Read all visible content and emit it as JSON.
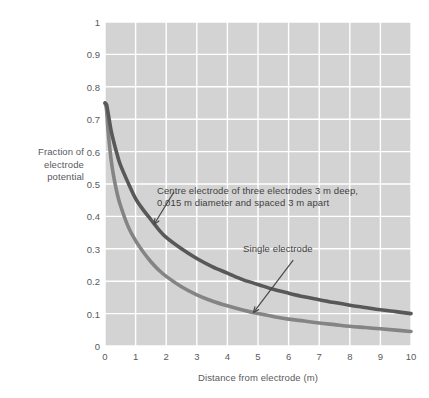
{
  "figure": {
    "name": "electrode-potential-decay-chart",
    "background_color": "#ffffff",
    "plot_background_color": "#d3d3d3",
    "gridline_color": "#ffffff"
  },
  "axes": {
    "y_title_lines": [
      "Fraction of",
      "electrode",
      "potential"
    ],
    "x_title": "Distance from electrode (m)",
    "y_ticks": [
      "0",
      "0.1",
      "0.2",
      "0.3",
      "0.4",
      "0.5",
      "0.6",
      "0.7",
      "0.8",
      "0.9",
      "1"
    ],
    "x_ticks": [
      "0",
      "1",
      "2",
      "3",
      "4",
      "5",
      "6",
      "7",
      "8",
      "9",
      "10"
    ]
  },
  "annotations": {
    "centre_electrode": {
      "line1": "Centre electrode of three electrodes 3 m deep,",
      "line2": "0.015 m diameter and spaced 3 m apart"
    },
    "single_electrode": {
      "label": "Single electrode"
    }
  },
  "chart_data": {
    "type": "line",
    "title": "",
    "subtitle": "",
    "xlabel": "Distance from electrode (m)",
    "ylabel": "Fraction of electrode potential",
    "xlim": [
      0,
      10
    ],
    "ylim": [
      0,
      1
    ],
    "grid": true,
    "legend_position": "inline-annotations",
    "x": [
      0,
      0.05,
      0.1,
      0.2,
      0.3,
      0.4,
      0.5,
      0.75,
      1,
      1.25,
      1.5,
      1.75,
      2,
      2.5,
      3,
      3.5,
      4,
      4.5,
      5,
      5.5,
      6,
      6.5,
      7,
      7.5,
      8,
      8.5,
      9,
      9.5,
      10
    ],
    "series": [
      {
        "name": "Centre electrode of three electrodes 3 m deep, 0.015 m diameter and spaced 3 m apart",
        "color": "#585859",
        "values": [
          0.75,
          0.745,
          0.72,
          0.665,
          0.625,
          0.59,
          0.56,
          0.505,
          0.455,
          0.42,
          0.39,
          0.36,
          0.335,
          0.3,
          0.27,
          0.245,
          0.225,
          0.205,
          0.19,
          0.175,
          0.163,
          0.152,
          0.143,
          0.134,
          0.126,
          0.119,
          0.112,
          0.106,
          0.1
        ]
      },
      {
        "name": "Single electrode",
        "color": "#848485",
        "values": [
          0.75,
          0.73,
          0.665,
          0.575,
          0.515,
          0.47,
          0.435,
          0.37,
          0.325,
          0.29,
          0.26,
          0.235,
          0.215,
          0.183,
          0.158,
          0.139,
          0.124,
          0.111,
          0.1,
          0.091,
          0.083,
          0.077,
          0.071,
          0.066,
          0.061,
          0.057,
          0.053,
          0.049,
          0.045
        ]
      }
    ],
    "annotations": [
      {
        "text": "Centre electrode of three electrodes 3 m deep, 0.015 m diameter and spaced 3 m apart",
        "points_to_series": "Centre electrode of three electrodes 3 m deep, 0.015 m diameter and spaced 3 m apart",
        "arrow_target_x": 1.6,
        "arrow_target_y": 0.375
      },
      {
        "text": "Single electrode",
        "points_to_series": "Single electrode",
        "arrow_target_x": 4.85,
        "arrow_target_y": 0.103
      }
    ]
  }
}
